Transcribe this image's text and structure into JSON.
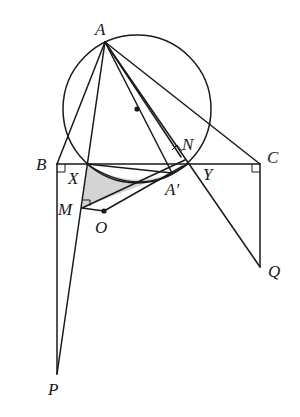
{
  "diagram": {
    "type": "geometry-figure",
    "colors": {
      "stroke": "#1a1a1a",
      "shade": "#d4d4d4",
      "background": "#ffffff"
    },
    "points": {
      "A": {
        "label": "A",
        "x": 105,
        "y": 42
      },
      "B": {
        "label": "B",
        "x": 57,
        "y": 164
      },
      "C": {
        "label": "C",
        "x": 260,
        "y": 164
      },
      "X": {
        "label": "X",
        "x": 87,
        "y": 164
      },
      "Y": {
        "label": "Y",
        "x": 188,
        "y": 164
      },
      "N": {
        "label": "N",
        "x": 181,
        "y": 157
      },
      "A_prime": {
        "label": "A′",
        "x": 172,
        "y": 173
      },
      "M": {
        "label": "M",
        "x": 82,
        "y": 208
      },
      "O": {
        "label": "O",
        "x": 104,
        "y": 211
      },
      "P": {
        "label": "P",
        "x": 57,
        "y": 374
      },
      "Q": {
        "label": "Q",
        "x": 260,
        "y": 267
      }
    },
    "circle": {
      "cx": 137,
      "cy": 109,
      "r": 74,
      "center_marked": true
    },
    "right_angle_marks": [
      "B",
      "C",
      "N",
      "M"
    ],
    "shaded_region": "X-A′-M"
  }
}
